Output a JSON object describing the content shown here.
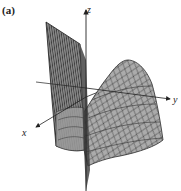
{
  "figure": {
    "panel_label": "(a)",
    "type": "3D surface plot (wireframe mesh)",
    "axes": {
      "x_label": "x",
      "y_label": "y",
      "z_label": "z"
    },
    "colors": {
      "surface_fill": "#a9a9a9",
      "surface_fill_dark": "#6e6e6e",
      "mesh_line": "#2a2a2a",
      "axis": "#222222",
      "background": "#ffffff"
    }
  }
}
